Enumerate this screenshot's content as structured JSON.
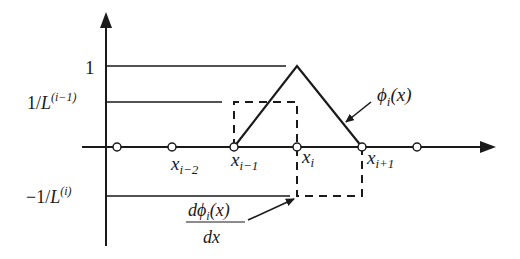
{
  "diagram": {
    "colors": {
      "stroke": "#1a1a1a",
      "background": "#ffffff",
      "node_fill": "#ffffff"
    },
    "y_axis": {
      "labels": {
        "one": "1",
        "pos_level_num": "1/",
        "pos_level_L": "L",
        "pos_level_sup": "(i−1)",
        "neg_level_num": "−1/",
        "neg_level_L": "L",
        "neg_level_sup": "(i)"
      }
    },
    "x_axis": {
      "nodes": [
        {
          "base": "",
          "sub": ""
        },
        {
          "base": "x",
          "sub": "i−2"
        },
        {
          "base": "x",
          "sub": "i−1"
        },
        {
          "base": "x",
          "sub": "i"
        },
        {
          "base": "x",
          "sub": "i+1"
        },
        {
          "base": "",
          "sub": ""
        }
      ]
    },
    "annotations": {
      "phi": {
        "symbol": "ϕ",
        "sub": "i",
        "arg": "(x)"
      },
      "derivative": {
        "num_d": "d",
        "num_phi": "ϕ",
        "num_sub": "i",
        "num_arg": "(x)",
        "den": "dx"
      }
    }
  }
}
